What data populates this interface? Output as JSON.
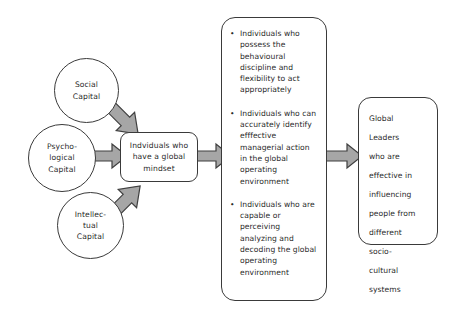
{
  "diagram": {
    "colors": {
      "shape_stroke": "#3a3a3a",
      "shape_fill": "#ffffff",
      "arrow_fill": "#a6a6a6",
      "arrow_stroke": "#3f3f3f",
      "text": "#2a2a2a",
      "background": "#ffffff"
    },
    "inputs": [
      {
        "id": "social",
        "label": "Social\nCapital"
      },
      {
        "id": "psychological",
        "label": "Psycho-\nlogical\nCapital"
      },
      {
        "id": "intellectual",
        "label": "Intellec-\ntual\nCapital"
      }
    ],
    "mindset_box": {
      "label": "Indviduals who\nhave a global\nmindset"
    },
    "outcomes_box": {
      "bullet_glyph": "•",
      "items": [
        "Individuals who possess the behavioural discipline and flexibility to act appropriately",
        "Individuals who can accurately identify efffective managerial action in the global operating environment",
        "Individuals who are capable or perceiving analyzing and decoding the global operating environment"
      ]
    },
    "leaders_box": {
      "label": "Global\nLeaders\nwho are\neffective in\ninfluencing\npeople from\ndifferent\nsocio-\ncultural\nsystems"
    },
    "arrows": [
      {
        "id": "social-to-mindset",
        "name": "arrow-social-to-mindset",
        "direction": "down-right"
      },
      {
        "id": "psychological-to-mindset",
        "name": "arrow-psychological-to-mindset",
        "direction": "right"
      },
      {
        "id": "intellectual-to-mindset",
        "name": "arrow-intellectual-to-mindset",
        "direction": "up-right"
      },
      {
        "id": "mindset-to-outcomes",
        "name": "arrow-mindset-to-outcomes",
        "direction": "right"
      },
      {
        "id": "outcomes-to-leaders",
        "name": "arrow-outcomes-to-leaders",
        "direction": "right"
      }
    ]
  }
}
